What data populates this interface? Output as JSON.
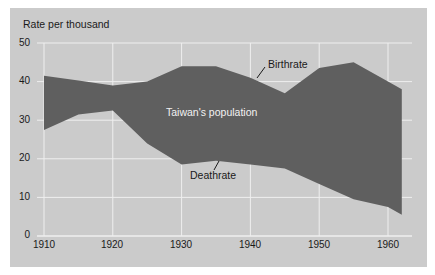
{
  "chart_data": {
    "type": "area",
    "title": "",
    "xlabel": "",
    "ylabel": "Rate per thousand",
    "xlim": [
      1910,
      1962
    ],
    "ylim": [
      0,
      50
    ],
    "grid": true,
    "x_ticks": [
      "1910",
      "1920",
      "1930",
      "1940",
      "1950",
      "1960"
    ],
    "y_ticks": [
      "0",
      "10",
      "20",
      "30",
      "40",
      "50"
    ],
    "x": [
      1910,
      1915,
      1920,
      1925,
      1930,
      1935,
      1940,
      1945,
      1950,
      1955,
      1960,
      1962
    ],
    "series": [
      {
        "name": "Birthrate",
        "values": [
          41.5,
          40.3,
          39,
          40,
          44,
          44,
          41,
          37,
          43.5,
          45,
          40,
          38
        ]
      },
      {
        "name": "Deathrate",
        "values": [
          27.5,
          31.5,
          32.5,
          24,
          18.5,
          19.5,
          18.5,
          17.5,
          13.5,
          9.5,
          7.5,
          5.5
        ]
      }
    ],
    "fill_between": {
      "upper": "Birthrate",
      "lower": "Deathrate",
      "label": "Taiwan's population",
      "color": "#5f5f5f"
    },
    "annotations": [
      "Birthrate",
      "Deathrate",
      "Taiwan's population"
    ],
    "legend": "none"
  },
  "labels": {
    "ylabel": "Rate per thousand",
    "birthrate": "Birthrate",
    "deathrate": "Deathrate",
    "population": "Taiwan's population",
    "yticks": [
      "0",
      "10",
      "20",
      "30",
      "40",
      "50"
    ],
    "xticks": [
      "1910",
      "1920",
      "1930",
      "1940",
      "1950",
      "1960"
    ]
  },
  "colors": {
    "background": "#cbcbcb",
    "fill": "#5f5f5f",
    "grid": "#efefef",
    "text": "#1a1a1a"
  }
}
